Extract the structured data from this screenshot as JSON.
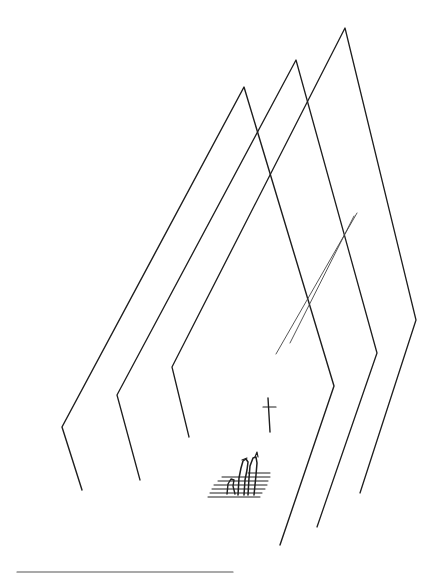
{
  "illustration": {
    "description": "Pen-and-ink sketch: three nested peaked church-like frames, a diagonal double line, a small cross, and a group of figures on steps",
    "ink_color": "#1e1e1e",
    "background": "#ffffff",
    "frames": [
      {
        "name": "frame-1",
        "points": "82,490 62,427 244,87 334,386 280,545",
        "width": 1.4
      },
      {
        "name": "frame-2",
        "points": "140,480 117,395 296,60 377,353 317,527",
        "width": 1.3
      },
      {
        "name": "frame-3",
        "points": "189,437 172,367 345,28 416,320 360,493",
        "width": 1.3
      }
    ],
    "diagonal_lines": [
      {
        "x1": 357,
        "y1": 213,
        "x2": 276,
        "y2": 354
      },
      {
        "x1": 354,
        "y1": 216,
        "x2": 290,
        "y2": 343
      }
    ],
    "cross": {
      "vertical": [
        268,
        398,
        270,
        432
      ],
      "horizontal": [
        263,
        407,
        276,
        407
      ]
    },
    "footer_rule": {
      "x1": 17,
      "y1": 572,
      "x2": 233,
      "y2": 572,
      "color": "#555555"
    }
  }
}
